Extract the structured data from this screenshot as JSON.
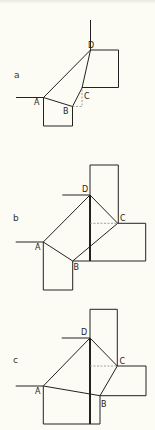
{
  "figure": {
    "panels": [
      {
        "id": "a",
        "label": "a",
        "points": {
          "A": "A",
          "B": "B",
          "C": "C",
          "D": "D"
        }
      },
      {
        "id": "b",
        "label": "b",
        "points": {
          "A": "A",
          "B": "B",
          "C": "C",
          "D": "D"
        }
      },
      {
        "id": "c",
        "label": "c",
        "points": {
          "A": "A",
          "B": "B",
          "C": "C",
          "D": "D"
        }
      }
    ]
  }
}
